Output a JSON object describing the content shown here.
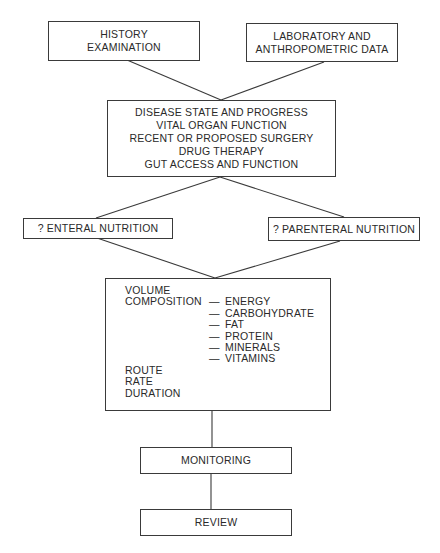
{
  "diagram": {
    "type": "flowchart",
    "topic": "Nutritional support decision pathway",
    "nodes": {
      "history": {
        "lines": [
          "HISTORY",
          "EXAMINATION"
        ]
      },
      "laboratory": {
        "lines": [
          "LABORATORY AND",
          "ANTHROPOMETRIC DATA"
        ]
      },
      "assessment": {
        "lines": [
          "DISEASE STATE AND PROGRESS",
          "VITAL ORGAN FUNCTION",
          "RECENT OR PROPOSED SURGERY",
          "DRUG THERAPY",
          "GUT ACCESS AND FUNCTION"
        ]
      },
      "enteral": {
        "label": "? ENTERAL NUTRITION"
      },
      "parenteral": {
        "label": "? PARENTERAL NUTRITION"
      },
      "prescription": {
        "volume": "VOLUME",
        "composition_label": "COMPOSITION",
        "dash": "—",
        "composition_items": [
          "ENERGY",
          "CARBOHYDRATE",
          "FAT",
          "PROTEIN",
          "MINERALS",
          "VITAMINS"
        ],
        "route": "ROUTE",
        "rate": "RATE",
        "duration": "DURATION"
      },
      "monitoring": {
        "label": "MONITORING"
      },
      "review": {
        "label": "REVIEW"
      }
    },
    "edges": [
      {
        "from": "history",
        "to": "assessment"
      },
      {
        "from": "laboratory",
        "to": "assessment"
      },
      {
        "from": "assessment",
        "to": "enteral"
      },
      {
        "from": "assessment",
        "to": "parenteral"
      },
      {
        "from": "enteral",
        "to": "prescription"
      },
      {
        "from": "parenteral",
        "to": "prescription"
      },
      {
        "from": "prescription",
        "to": "monitoring"
      },
      {
        "from": "monitoring",
        "to": "review"
      }
    ],
    "colors": {
      "line": "#3a3a3a",
      "text": "#2a2a2a",
      "background": "#ffffff"
    }
  }
}
